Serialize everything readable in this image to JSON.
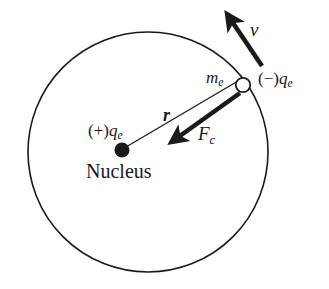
{
  "figure": {
    "background_color": "#ffffff",
    "stroke_color": "#1a1a1a"
  },
  "labels": {
    "velocity": {
      "symbol": "v",
      "subscript": ""
    },
    "electron_mass": {
      "symbol": "m",
      "subscript": "e"
    },
    "electron_charge": {
      "prefix": "(−)",
      "symbol": "q",
      "subscript": "e"
    },
    "radius": {
      "symbol": "r",
      "subscript": ""
    },
    "centripetal_force": {
      "symbol": "F",
      "subscript": "c"
    },
    "nucleus_charge": {
      "prefix": "(+)",
      "symbol": "q",
      "subscript": "e"
    },
    "nucleus": {
      "text": "Nucleus"
    }
  },
  "geometry": {
    "orbit": {
      "cx": 148,
      "cy": 152,
      "r": 120,
      "stroke_width": 1.6,
      "fill": "none"
    },
    "nucleus_dot": {
      "cx": 122,
      "cy": 150,
      "r": 7.5,
      "fill": "#1a1a1a"
    },
    "electron_circle": {
      "cx": 243,
      "cy": 85,
      "r": 7.5,
      "fill": "#ffffff",
      "stroke_width": 1.8
    },
    "radius_line": {
      "x1": 126,
      "y1": 147,
      "x2": 238,
      "y2": 81,
      "stroke_width": 1.3
    },
    "velocity_arrow": {
      "x1": 262,
      "y1": 66,
      "x2": 227,
      "y2": 14,
      "stroke_width": 4.4
    },
    "force_arrow": {
      "x1": 238,
      "y1": 92,
      "x2": 172,
      "y2": 140,
      "stroke_width": 4.4
    }
  }
}
